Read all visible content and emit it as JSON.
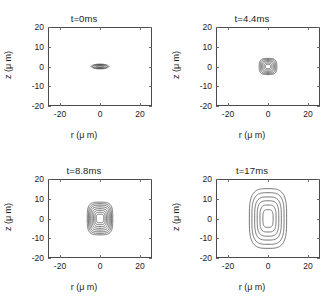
{
  "figure": {
    "panel_count": 4,
    "background_color": "#ffffff",
    "line_color": "#3b3b3b"
  },
  "axis": {
    "xlabel": "r (μ m)",
    "ylabel": "z (μ m)",
    "xticks": [
      "-20",
      "0",
      "20"
    ],
    "yticks": [
      "20",
      "10",
      "0",
      "-10",
      "-20"
    ],
    "xlim": [
      -26,
      26
    ],
    "ylim": [
      -20,
      20
    ],
    "xtick_values": [
      -20,
      0,
      20
    ],
    "ytick_values": [
      20,
      10,
      0,
      -10,
      -20
    ]
  },
  "panels": [
    {
      "title": "t=0ms",
      "time_ms": 0,
      "contour_count": 5,
      "shape": "flat wide ellipse",
      "extent_r": 4.5,
      "extent_z": 1.2,
      "note": "very tightly packed contours appear as a dark filled lens"
    },
    {
      "title": "t=4.4ms",
      "time_ms": 4.4,
      "contour_count": 6,
      "shape": "rounded square",
      "extent_r": 4.5,
      "extent_z": 4.2,
      "note": "nearly isotropic nested rounded contours"
    },
    {
      "title": "t=8.8ms",
      "time_ms": 8.8,
      "contour_count": 8,
      "shape": "rounded rectangle, taller than wide",
      "extent_r": 6.5,
      "extent_z": 8.5,
      "note": "eight nested contours with open center"
    },
    {
      "title": "t=17ms",
      "time_ms": 17,
      "contour_count": 6,
      "shape": "vertically elongated rounded rectangle",
      "extent_r": 9.5,
      "extent_z": 15.5,
      "note": "six widely spaced nested contours"
    }
  ],
  "chart_data": {
    "type": "line",
    "title": "",
    "xlabel": "r (μ m)",
    "ylabel": "z (μ m)",
    "xlim": [
      -26,
      26
    ],
    "ylim": [
      -20,
      20
    ],
    "grid": false,
    "legend": null,
    "subplots": [
      {
        "title": "t=0ms",
        "contours": [
          {
            "level": 1,
            "half_width_r": 1.2,
            "half_width_z": 0.35
          },
          {
            "level": 2,
            "half_width_r": 2.1,
            "half_width_z": 0.6
          },
          {
            "level": 3,
            "half_width_r": 3.0,
            "half_width_z": 0.85
          },
          {
            "level": 4,
            "half_width_r": 3.8,
            "half_width_z": 1.05
          },
          {
            "level": 5,
            "half_width_r": 4.5,
            "half_width_z": 1.25
          }
        ]
      },
      {
        "title": "t=4.4ms",
        "contours": [
          {
            "level": 1,
            "half_width_r": 1.3,
            "half_width_z": 1.1
          },
          {
            "level": 2,
            "half_width_r": 2.0,
            "half_width_z": 1.8
          },
          {
            "level": 3,
            "half_width_r": 2.7,
            "half_width_z": 2.5
          },
          {
            "level": 4,
            "half_width_r": 3.3,
            "half_width_z": 3.1
          },
          {
            "level": 5,
            "half_width_r": 3.9,
            "half_width_z": 3.7
          },
          {
            "level": 6,
            "half_width_r": 4.5,
            "half_width_z": 4.2
          }
        ]
      },
      {
        "title": "t=8.8ms",
        "contours": [
          {
            "level": 1,
            "half_width_r": 1.9,
            "half_width_z": 2.2
          },
          {
            "level": 2,
            "half_width_r": 2.6,
            "half_width_z": 3.2
          },
          {
            "level": 3,
            "half_width_r": 3.3,
            "half_width_z": 4.2
          },
          {
            "level": 4,
            "half_width_r": 4.0,
            "half_width_z": 5.1
          },
          {
            "level": 5,
            "half_width_r": 4.7,
            "half_width_z": 6.0
          },
          {
            "level": 6,
            "half_width_r": 5.3,
            "half_width_z": 6.9
          },
          {
            "level": 7,
            "half_width_r": 5.9,
            "half_width_z": 7.7
          },
          {
            "level": 8,
            "half_width_r": 6.5,
            "half_width_z": 8.5
          }
        ]
      },
      {
        "title": "t=17ms",
        "contours": [
          {
            "level": 1,
            "half_width_r": 2.6,
            "half_width_z": 4.6
          },
          {
            "level": 2,
            "half_width_r": 4.1,
            "half_width_z": 7.0
          },
          {
            "level": 3,
            "half_width_r": 5.5,
            "half_width_z": 9.2
          },
          {
            "level": 4,
            "half_width_r": 6.8,
            "half_width_z": 11.2
          },
          {
            "level": 5,
            "half_width_r": 8.2,
            "half_width_z": 13.4
          },
          {
            "level": 6,
            "half_width_r": 9.5,
            "half_width_z": 15.5
          }
        ]
      }
    ]
  }
}
